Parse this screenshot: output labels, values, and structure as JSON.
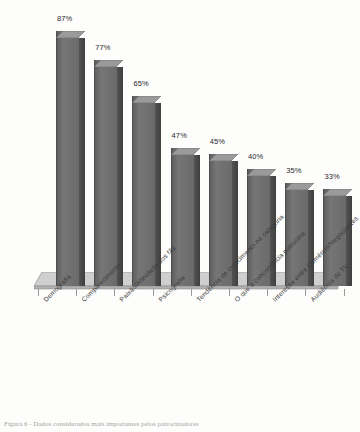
{
  "figure": {
    "caption": "Figura 6 - Dados considerados mais importantes pelos patrocinadores",
    "background_color": "#fdfdfc"
  },
  "chart_data": {
    "type": "bar",
    "title": "",
    "subtitle": "",
    "xlabel": "",
    "ylabel": "",
    "grid": false,
    "legend": null,
    "style": "3d-column",
    "value_suffix": "%",
    "ylim": [
      0,
      100
    ],
    "categories": [
      "Demografia",
      "Comparecimento",
      "Paixão/Afinidade dos fãs",
      "Psicografia",
      "Tendência de crescimento na categoria",
      "O que a concorrência patrocina",
      "Interesse entre Comércio/Negociantes",
      "Audiência de TV"
    ],
    "values": [
      87,
      77,
      65,
      47,
      45,
      40,
      35,
      33
    ],
    "value_labels": [
      "87%",
      "77%",
      "65%",
      "47%",
      "45%",
      "40%",
      "35%",
      "33%"
    ],
    "colors": {
      "bar_front": "#6e6e6e",
      "bar_side": "#4b4b4b",
      "bar_top": "#9a9a9a",
      "floor_top": "#cfcfcf",
      "floor_front": "#b3b3b3",
      "label_text": "#2a2a2a",
      "category_text": "#3a3a3a"
    }
  }
}
